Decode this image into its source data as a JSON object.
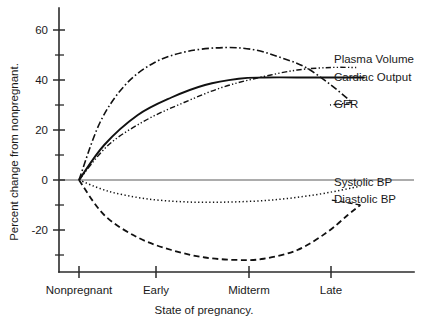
{
  "chart_data": {
    "type": "line",
    "title": "",
    "xlabel": "State of pregnancy.",
    "ylabel": "Percent change from nonpregnant.",
    "categories": [
      "Nonpregnant",
      "Early",
      "Midterm",
      "Late"
    ],
    "x": [
      0,
      1,
      2,
      3
    ],
    "ylim": [
      -35,
      65
    ],
    "xlim": [
      -0.15,
      3.55
    ],
    "yticks_major": [
      60,
      40,
      20,
      0,
      -20
    ],
    "yticks_major_labels": [
      "60",
      "40",
      "20",
      "0",
      "-20"
    ],
    "yticks_minor": [
      50,
      30,
      10,
      -10,
      -30
    ],
    "grid": false,
    "legend_position": "right-inline-annotations",
    "series": [
      {
        "name": "Plasma Volume",
        "linestyle": "dash-dot-dot",
        "color": "#111111",
        "label_x_px": 334,
        "label_y_px": 63,
        "points": [
          [
            0,
            0
          ],
          [
            0.35,
            14
          ],
          [
            0.8,
            24
          ],
          [
            1.25,
            31
          ],
          [
            1.7,
            37
          ],
          [
            2.15,
            41
          ],
          [
            2.6,
            44
          ],
          [
            3.0,
            45
          ],
          [
            3.3,
            45
          ]
        ],
        "values_at_categories": [
          0,
          27,
          41,
          45
        ]
      },
      {
        "name": "Cardiac Output",
        "linestyle": "solid",
        "color": "#111111",
        "label_x_px": 334,
        "label_y_px": 81,
        "points": [
          [
            0,
            0
          ],
          [
            0.3,
            14
          ],
          [
            0.7,
            26
          ],
          [
            1.1,
            33
          ],
          [
            1.5,
            38
          ],
          [
            1.9,
            40.5
          ],
          [
            2.2,
            41
          ],
          [
            2.8,
            41
          ],
          [
            3.4,
            41
          ]
        ],
        "values_at_categories": [
          0,
          31,
          41,
          41
        ]
      },
      {
        "name": "GFR",
        "linestyle": "dash-dot",
        "color": "#111111",
        "label_x_px": 334,
        "label_y_px": 108,
        "points": [
          [
            0,
            0
          ],
          [
            0.25,
            23
          ],
          [
            0.55,
            38
          ],
          [
            0.9,
            47
          ],
          [
            1.3,
            51.5
          ],
          [
            1.75,
            53
          ],
          [
            2.1,
            52
          ],
          [
            2.4,
            49
          ],
          [
            2.7,
            45
          ],
          [
            3.0,
            38
          ],
          [
            3.25,
            31
          ]
        ],
        "values_at_categories": [
          0,
          49,
          53,
          38
        ]
      },
      {
        "name": "Systolic BP",
        "linestyle": "dotted",
        "color": "#111111",
        "label_x_px": 334,
        "label_y_px": 186,
        "points": [
          [
            0,
            0
          ],
          [
            0.35,
            -4.5
          ],
          [
            0.8,
            -7.5
          ],
          [
            1.3,
            -8.8
          ],
          [
            1.8,
            -8.8
          ],
          [
            2.3,
            -8.0
          ],
          [
            2.8,
            -6.0
          ],
          [
            3.2,
            -3.5
          ],
          [
            3.35,
            -2.5
          ]
        ],
        "values_at_categories": [
          0,
          -7.5,
          -8.5,
          -4
        ]
      },
      {
        "name": "Diastolic BP",
        "linestyle": "dashed",
        "color": "#111111",
        "label_x_px": 334,
        "label_y_px": 203,
        "points": [
          [
            0,
            0
          ],
          [
            0.3,
            -14
          ],
          [
            0.7,
            -23
          ],
          [
            1.1,
            -28
          ],
          [
            1.5,
            -31
          ],
          [
            1.9,
            -32
          ],
          [
            2.2,
            -31.5
          ],
          [
            2.6,
            -28
          ],
          [
            2.95,
            -21
          ],
          [
            3.2,
            -14
          ],
          [
            3.35,
            -10
          ]
        ],
        "values_at_categories": [
          0,
          -25,
          -32,
          -18
        ]
      }
    ]
  },
  "axes": {
    "y_title": "Percent change from nonpregnant.",
    "x_title": "State of pregnancy.",
    "y_tick_labels": [
      "60",
      "40",
      "20",
      "0",
      "-20"
    ],
    "x_tick_labels": [
      "Nonpregnant",
      "Early",
      "Midterm",
      "Late"
    ]
  },
  "series_labels": {
    "plasma_volume": "Plasma Volume",
    "cardiac_output": "Cardiac Output",
    "gfr": "GFR",
    "systolic_bp": "Systolic BP",
    "diastolic_bp": "Diastolic BP"
  }
}
